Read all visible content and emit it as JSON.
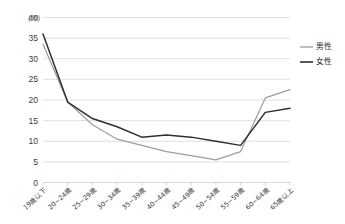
{
  "chart_data": {
    "type": "line",
    "title": "",
    "xlabel": "",
    "ylabel": "",
    "yunit": "(%)",
    "ylim": [
      0,
      40
    ],
    "ystep": 5,
    "yticks": [
      "0",
      "5",
      "10",
      "15",
      "20",
      "25",
      "30",
      "35",
      "40"
    ],
    "grid": true,
    "legend_position": "right",
    "categories": [
      "19歳以下",
      "20~24歳",
      "25~29歳",
      "30~34歳",
      "35~39歳",
      "40~44歳",
      "45~49歳",
      "50~54歳",
      "55~59歳",
      "60~64歳",
      "65歳以上"
    ],
    "series": [
      {
        "name": "男性",
        "color": "#9d9d9d",
        "values": [
          33.5,
          19.5,
          14.0,
          10.5,
          9.0,
          7.5,
          6.5,
          5.5,
          7.5,
          20.5,
          22.5
        ]
      },
      {
        "name": "女性",
        "color": "#2f2f2f",
        "values": [
          36.0,
          19.5,
          15.5,
          13.5,
          11.0,
          11.5,
          11.0,
          10.0,
          9.0,
          17.0,
          18.0
        ]
      }
    ]
  },
  "legend": {
    "entries": [
      {
        "label": "男性"
      },
      {
        "label": "女性"
      }
    ]
  }
}
